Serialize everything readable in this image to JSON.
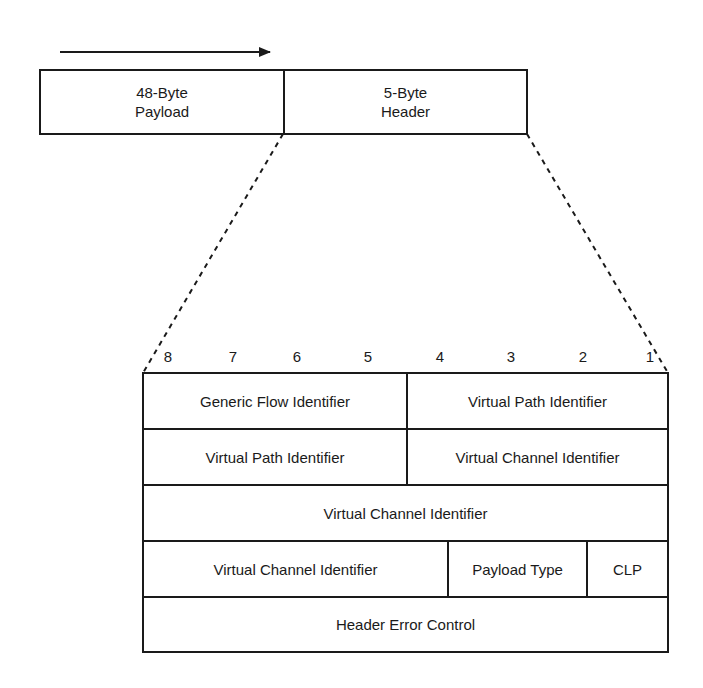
{
  "diagram": {
    "direction_arrow": "transmission-direction-arrow",
    "cell": {
      "payload": {
        "line1": "48-Byte",
        "line2": "Payload"
      },
      "header": {
        "line1": "5-Byte",
        "line2": "Header"
      }
    },
    "bit_numbers": [
      "8",
      "7",
      "6",
      "5",
      "4",
      "3",
      "2",
      "1"
    ],
    "header_fields": {
      "row1": [
        "Generic Flow Identifier",
        "Virtual Path Identifier"
      ],
      "row2": [
        "Virtual Path Identifier",
        "Virtual Channel Identifier"
      ],
      "row3": [
        "Virtual Channel Identifier"
      ],
      "row4": [
        "Virtual Channel Identifier",
        "Payload Type",
        "CLP"
      ],
      "row5": [
        "Header Error Control"
      ]
    }
  }
}
